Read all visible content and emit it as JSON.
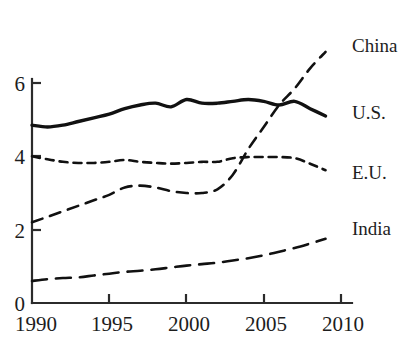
{
  "chart_data": {
    "type": "line",
    "title": "",
    "xlabel": "",
    "ylabel": "",
    "xlim": [
      1990,
      2010
    ],
    "ylim": [
      0,
      6.6
    ],
    "grid": false,
    "legend_position": "right-of-plot-end-labels",
    "x_ticks": [
      "1990",
      "1995",
      "2000",
      "2005",
      "2010"
    ],
    "x_tick_values": [
      1990,
      1995,
      2000,
      2005,
      2010
    ],
    "y_ticks": [
      "0",
      "2",
      "4",
      "6"
    ],
    "y_tick_values": [
      0,
      2,
      4,
      6
    ],
    "x": [
      1990,
      1991,
      1992,
      1993,
      1994,
      1995,
      1996,
      1997,
      1998,
      1999,
      2000,
      2001,
      2002,
      2003,
      2004,
      2005,
      2006,
      2007,
      2008,
      2009
    ],
    "series": [
      {
        "name": "China",
        "label": "China",
        "line_style": "dashed",
        "color": "#111111",
        "values": [
          2.2,
          2.35,
          2.5,
          2.65,
          2.8,
          2.95,
          3.15,
          3.2,
          3.15,
          3.05,
          3.0,
          3.0,
          3.1,
          3.5,
          4.2,
          4.8,
          5.4,
          5.85,
          6.4,
          6.85
        ]
      },
      {
        "name": "U.S.",
        "label": "U.S.",
        "line_style": "solid",
        "color": "#111111",
        "values": [
          4.85,
          4.8,
          4.85,
          4.95,
          5.05,
          5.15,
          5.3,
          5.4,
          5.45,
          5.35,
          5.55,
          5.45,
          5.45,
          5.5,
          5.55,
          5.5,
          5.4,
          5.5,
          5.3,
          5.1
        ]
      },
      {
        "name": "E.U.",
        "label": "E.U.",
        "line_style": "dotted-dashed",
        "color": "#111111",
        "values": [
          4.0,
          3.92,
          3.85,
          3.82,
          3.82,
          3.85,
          3.9,
          3.85,
          3.82,
          3.8,
          3.82,
          3.85,
          3.85,
          3.95,
          3.98,
          3.98,
          3.98,
          3.95,
          3.8,
          3.62
        ]
      },
      {
        "name": "India",
        "label": "India",
        "line_style": "long-dashed",
        "color": "#111111",
        "values": [
          0.6,
          0.65,
          0.68,
          0.7,
          0.75,
          0.8,
          0.85,
          0.88,
          0.92,
          0.97,
          1.02,
          1.06,
          1.1,
          1.16,
          1.22,
          1.3,
          1.4,
          1.5,
          1.62,
          1.75
        ]
      }
    ],
    "series_labels": [
      {
        "text": "China",
        "x": 352,
        "y": 46
      },
      {
        "text": "U.S.",
        "x": 352,
        "y": 113
      },
      {
        "text": "E.U.",
        "x": 352,
        "y": 173
      },
      {
        "text": "India",
        "x": 352,
        "y": 229
      }
    ],
    "axis_label_positions": {
      "y": [
        {
          "text": "6",
          "x": 25,
          "y": 91
        },
        {
          "text": "4",
          "x": 25,
          "y": 165
        },
        {
          "text": "2",
          "x": 25,
          "y": 238
        },
        {
          "text": "0",
          "x": 25,
          "y": 311
        }
      ],
      "x": [
        {
          "text": "1990",
          "x": 35,
          "y": 331
        },
        {
          "text": "1995",
          "x": 112,
          "y": 331
        },
        {
          "text": "2000",
          "x": 189,
          "y": 331
        },
        {
          "text": "2005",
          "x": 266,
          "y": 331
        },
        {
          "text": "2010",
          "x": 343,
          "y": 331
        }
      ]
    }
  },
  "colors": {
    "background": "#ffffff",
    "ink": "#111111",
    "axis": "#2b2b2b"
  }
}
